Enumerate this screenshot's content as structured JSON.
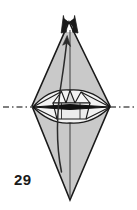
{
  "figure": {
    "kind": "origami-step-diagram",
    "step_number": "29",
    "background_color": "#ffffff",
    "paper_fill": "#c9c9c9",
    "paper_fill_light": "#e0e0e0",
    "paper_fill_white": "#f4f4f4",
    "outline_color": "#1a1a1a",
    "crease_color": "#3a3a3a",
    "arrow_color": "#2b2b2b",
    "axis_color": "#555555",
    "label_color": "#1a1a1a"
  },
  "shapes": {
    "outer_body": {
      "name": "folded-paper-body",
      "description": "tall vertical diamond / kite with forked top tip and single bottom point",
      "top_tip": [
        69,
        18
      ],
      "bottom_tip": [
        70,
        200
      ],
      "left_vertex": [
        32,
        106
      ],
      "right_vertex": [
        110,
        106
      ]
    },
    "forked_tip": {
      "name": "split-top-points",
      "prong_count": 2,
      "left_prong_tip": [
        64,
        16
      ],
      "right_prong_tip": [
        74,
        16
      ],
      "notch_bottom": [
        69,
        27
      ]
    },
    "middle_lens": {
      "name": "horizontal-lens-band",
      "left_point": [
        33,
        107
      ],
      "right_point": [
        110,
        107
      ],
      "top_apex": [
        70,
        91
      ],
      "bottom_apex": [
        70,
        123
      ]
    },
    "inner_facets": {
      "name": "triangular-crease-facets",
      "count": 3,
      "peaks": [
        [
          61,
          93
        ],
        [
          70,
          91
        ],
        [
          80,
          93
        ]
      ]
    },
    "center_line": {
      "name": "vertical-center-crease",
      "x": 70,
      "y_top": 30,
      "y_bottom": 198
    }
  },
  "annotations": {
    "fold_axis": {
      "name": "horizontal-fold-axis",
      "line_style": "dash-dot",
      "y": 107,
      "x_start": 3,
      "x_end": 134,
      "label": ""
    },
    "thick_fold_edge": {
      "name": "thick-horizontal-fold-edge",
      "y": 107,
      "x_start": 33,
      "x_end": 110,
      "stroke_width": 3
    },
    "action_arrow": {
      "name": "fold-up-arrow",
      "direction": "up",
      "start": [
        62,
        172
      ],
      "end": [
        67,
        36
      ],
      "description": "curved arrow sweeping upward along the body indicating fold/rotate upward"
    }
  },
  "labels": {
    "step": "29"
  }
}
